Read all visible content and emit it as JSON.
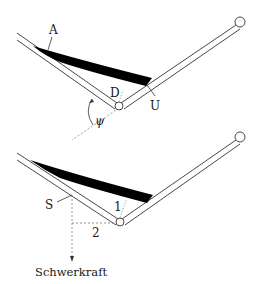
{
  "figure_top": {
    "labels": {
      "A": "A",
      "D": "D",
      "U": "U",
      "psi": "ψ"
    }
  },
  "figure_bottom": {
    "labels": {
      "S": "S",
      "one": "1",
      "two": "2",
      "gravity": "Schwerkraft"
    }
  },
  "colors": {
    "ink": "#1a1a1a",
    "wedge": "#000000",
    "dashed": "#777777"
  }
}
